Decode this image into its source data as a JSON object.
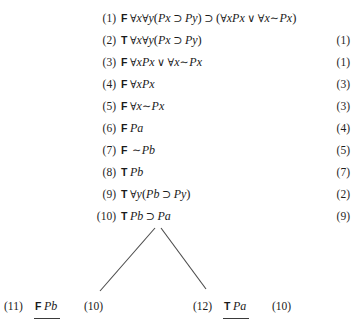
{
  "document": {
    "kind": "semantic-tableau-proof",
    "background_color": "#ffffff",
    "text_color": "#1a1a1a"
  },
  "proof": {
    "lines": [
      {
        "number": "(1)",
        "sign": "F",
        "formula_plain": "∀x∀y(Px ⊃ Py) ⊃ (∀xPx ∨ ∀x∼Px)",
        "justification": ""
      },
      {
        "number": "(2)",
        "sign": "T",
        "formula_plain": "∀x∀y(Px ⊃ Py)",
        "justification": "(1)"
      },
      {
        "number": "(3)",
        "sign": "F",
        "formula_plain": "∀xPx ∨ ∀x∼Px",
        "justification": "(1)"
      },
      {
        "number": "(4)",
        "sign": "F",
        "formula_plain": "∀xPx",
        "justification": "(3)"
      },
      {
        "number": "(5)",
        "sign": "F",
        "formula_plain": "∀x∼Px",
        "justification": "(3)"
      },
      {
        "number": "(6)",
        "sign": "F",
        "formula_plain": "Pa",
        "justification": "(4)"
      },
      {
        "number": "(7)",
        "sign": "F",
        "formula_plain": "∼Pb",
        "justification": "(5)"
      },
      {
        "number": "(8)",
        "sign": "T",
        "formula_plain": "Pb",
        "justification": "(7)"
      },
      {
        "number": "(9)",
        "sign": "T",
        "formula_plain": "∀y(Pb ⊃ Py)",
        "justification": "(2)"
      },
      {
        "number": "(10)",
        "sign": "T",
        "formula_plain": "Pb ⊃ Pa",
        "justification": "(9)"
      }
    ],
    "branches": [
      {
        "number": "(11)",
        "sign": "F",
        "formula_plain": "Pb",
        "justification": "(10)",
        "closed": true
      },
      {
        "number": "(12)",
        "sign": "T",
        "formula_plain": "Pa",
        "justification": "(10)",
        "closed": true
      }
    ]
  },
  "symbols": {
    "forall": "∀",
    "implies": "⊃",
    "or": "∨",
    "not": "∼",
    "sign_true": "T",
    "sign_false": "F"
  }
}
